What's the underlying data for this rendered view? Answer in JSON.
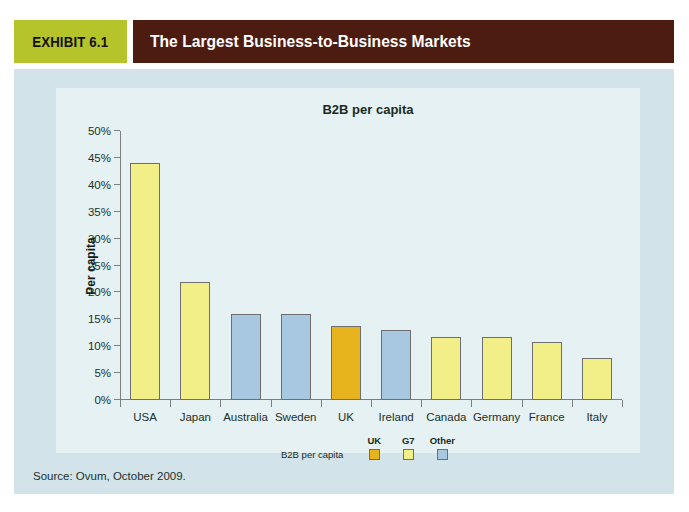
{
  "header": {
    "exhibit_label": "EXHIBIT 6.1",
    "title": "The Largest Business-to-Business Markets",
    "tag_bg": "#b6c42c",
    "bar_bg": "#4c1c11"
  },
  "panel": {
    "bg": "#d2e4e9",
    "card_bg": "#e6f1f3"
  },
  "source": "Source: Ovum, October 2009.",
  "legend": {
    "row_label": "B2B per capita",
    "columns": [
      {
        "label": "UK",
        "color": "#e8b41e"
      },
      {
        "label": "G7",
        "color": "#f2ef88"
      },
      {
        "label": "Other",
        "color": "#a7c8e0"
      }
    ]
  },
  "chart_data": {
    "type": "bar",
    "title": "B2B per capita",
    "xlabel": "",
    "ylabel": "Per capita",
    "ylim": [
      0,
      50
    ],
    "ytick_values": [
      0,
      5,
      10,
      15,
      20,
      25,
      30,
      35,
      40,
      45,
      50
    ],
    "ytick_labels": [
      "0%",
      "5%",
      "10%",
      "15%",
      "20%",
      "25%",
      "30%",
      "35%",
      "40%",
      "45%",
      "50%"
    ],
    "grid": false,
    "legend_position": "below-axis",
    "categories": [
      "USA",
      "Japan",
      "Australia",
      "Sweden",
      "UK",
      "Ireland",
      "Canada",
      "Germany",
      "France",
      "Italy"
    ],
    "values": [
      44,
      22,
      16,
      16,
      13.8,
      13,
      11.8,
      11.8,
      10.8,
      7.8
    ],
    "groups": [
      "G7",
      "G7",
      "Other",
      "Other",
      "UK",
      "Other",
      "G7",
      "G7",
      "G7",
      "G7"
    ],
    "series": [
      {
        "name": "B2B per capita",
        "values": [
          44,
          22,
          16,
          16,
          13.8,
          13,
          11.8,
          11.8,
          10.8,
          7.8
        ]
      }
    ],
    "group_colors": {
      "UK": "#e8b41e",
      "G7": "#f2ef88",
      "Other": "#a7c8e0"
    }
  }
}
